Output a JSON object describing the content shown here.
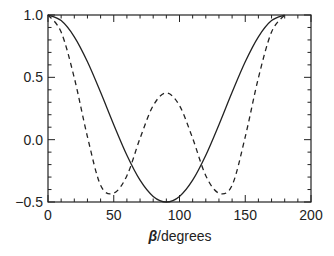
{
  "chart_data": {
    "type": "line",
    "title": "",
    "xlabel": "β/degrees",
    "xlabel_symbol": "β",
    "xlabel_unit": "/degrees",
    "ylabel": "",
    "xlim": [
      0,
      200
    ],
    "ylim": [
      -0.5,
      1.0
    ],
    "xticks": [
      0,
      50,
      100,
      150,
      200
    ],
    "xtick_labels": [
      "0",
      "50",
      "100",
      "150",
      "200"
    ],
    "yticks": [
      -0.5,
      0.0,
      0.5,
      1.0
    ],
    "ytick_labels": [
      "−0.5",
      "0.0",
      "0.5",
      "1.0"
    ],
    "grid": false,
    "legend": "none",
    "series": [
      {
        "name": "P2(cos β)",
        "style": "solid",
        "x": [
          0,
          10,
          20,
          30,
          40,
          50,
          60,
          70,
          80,
          90,
          100,
          110,
          120,
          130,
          140,
          150,
          160,
          170,
          180
        ],
        "values": [
          1.0,
          0.955,
          0.825,
          0.625,
          0.38,
          0.12,
          -0.125,
          -0.325,
          -0.455,
          -0.5,
          -0.455,
          -0.325,
          -0.125,
          0.12,
          0.38,
          0.625,
          0.825,
          0.955,
          1.0
        ]
      },
      {
        "name": "P4(cos β)",
        "style": "dashed",
        "x": [
          0,
          10,
          20,
          30,
          40,
          50,
          60,
          70,
          80,
          90,
          100,
          110,
          120,
          130,
          140,
          150,
          160,
          170,
          180
        ],
        "values": [
          1.0,
          0.863,
          0.496,
          0.023,
          -0.366,
          -0.429,
          -0.289,
          0.011,
          0.273,
          0.375,
          0.273,
          0.011,
          -0.289,
          -0.429,
          -0.366,
          0.023,
          0.496,
          0.863,
          1.0
        ]
      }
    ]
  },
  "colors": {
    "axis": "#222222",
    "line": "#222222",
    "background": "#ffffff"
  }
}
